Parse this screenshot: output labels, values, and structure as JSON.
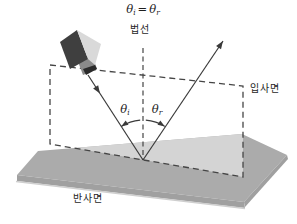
{
  "figure": {
    "title_hint": "law-of-reflection-diagram",
    "labels": {
      "equation": {
        "lhs_base": "θ",
        "lhs_sub": "i",
        "operator": "=",
        "rhs_base": "θ",
        "rhs_sub": "r"
      },
      "normal_line": "법선",
      "incidence_plane": "입사면",
      "reflection_surface": "반사면",
      "angle_incidence": {
        "base": "θ",
        "sub": "i"
      },
      "angle_reflection": {
        "base": "θ",
        "sub": "r"
      }
    },
    "colors": {
      "background": "#ffffff",
      "surface_top": "#ababab",
      "surface_highlight": "#d4d4d4",
      "surface_front": "#a0a0a0",
      "surface_bottom_edge": "#cfcfcf",
      "camera_dark": "#3f3f3f",
      "camera_light": "#d9d9d9",
      "camera_lens": "#8a8a8a",
      "camera_lens_tip": "#2b2b2b",
      "line": "#3a3a3a",
      "dash": "#454545",
      "text": "#1e1e1e"
    }
  }
}
